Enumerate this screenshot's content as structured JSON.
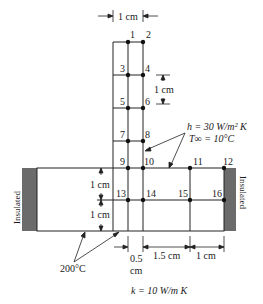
{
  "diagram": {
    "nodes": [
      {
        "id": "1",
        "label": "1"
      },
      {
        "id": "2",
        "label": "2"
      },
      {
        "id": "3",
        "label": "3"
      },
      {
        "id": "4",
        "label": "4"
      },
      {
        "id": "5",
        "label": "5"
      },
      {
        "id": "6",
        "label": "6"
      },
      {
        "id": "7",
        "label": "7"
      },
      {
        "id": "8",
        "label": "8"
      },
      {
        "id": "9",
        "label": "9"
      },
      {
        "id": "10",
        "label": "10"
      },
      {
        "id": "11",
        "label": "11"
      },
      {
        "id": "12",
        "label": "12"
      },
      {
        "id": "13",
        "label": "13"
      },
      {
        "id": "14",
        "label": "14"
      },
      {
        "id": "15",
        "label": "15"
      },
      {
        "id": "16",
        "label": "16"
      }
    ],
    "dimensions": {
      "fin_width": "1 cm",
      "vertical_spacing": "1 cm",
      "bar_upper_half": "1 cm",
      "bar_lower_half": "1 cm",
      "half_spacing_value": "0.5",
      "half_spacing_unit": "cm",
      "spacing_1_5": "1.5 cm",
      "spacing_1": "1 cm"
    },
    "conditions": {
      "convection_h": "h = 30 W/m² K",
      "ambient_temp": "T∞ = 10°C",
      "base_temp": "200°C",
      "conductivity": "k = 10 W/m K"
    },
    "insulation": {
      "left_label": "Insulated",
      "right_label": "Insulated"
    },
    "colors": {
      "line": "#222222",
      "insulation": "#6b6b6b",
      "node": "#111111"
    }
  }
}
